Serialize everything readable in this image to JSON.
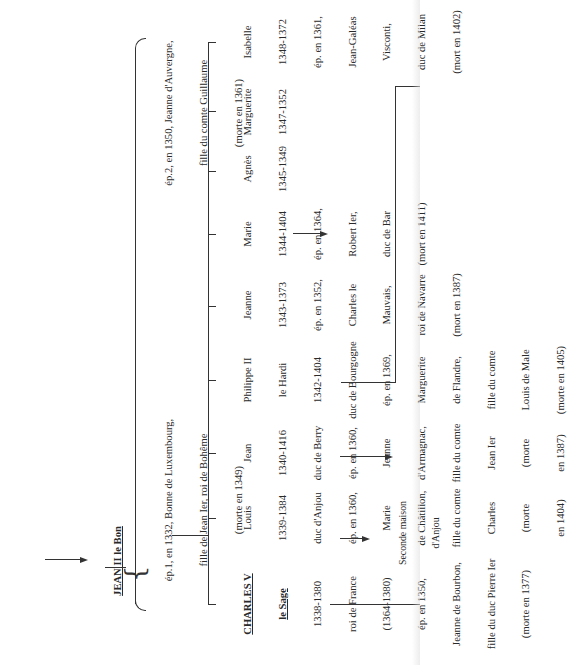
{
  "root": {
    "name": "JEAN II le Bon"
  },
  "spouses": [
    {
      "lines": [
        "ép.1, en 1332, Bonne de Luxembourg,",
        "fille de Jean Ier, roi de Bohême",
        "(morte en 1349)"
      ]
    },
    {
      "lines": [
        "ép.2, en 1350, Jeanne d'Auvergne,",
        "fille du comte Guillaume",
        "(morte en 1361)"
      ]
    }
  ],
  "children": [
    {
      "name": "CHARLES V",
      "epithet": "le Sage",
      "lines": [
        "1338-1380",
        "roi de France",
        "(1364-1380)",
        "ép. en 1350,",
        "Jeanne de Bourbon,",
        "fille du duc Pierre Ier",
        "(morte en 1377)"
      ]
    },
    {
      "name": "Louis",
      "lines": [
        "1339-1384",
        "duc d'Anjou",
        "ép. en 1360,",
        "Marie",
        "de Châtillon,",
        "fille du comte",
        "Charles",
        "(morte",
        "en 1404)"
      ],
      "arrow_label": [
        "Seconde maison",
        "d'Anjou"
      ]
    },
    {
      "name": "Jean",
      "lines": [
        "1340-1416",
        "duc de Berry",
        "ép. en 1360,",
        "Jeanne",
        "d'Armagnac,",
        "fille du comte",
        "Jean Ier",
        "(morte",
        "en 1387)"
      ]
    },
    {
      "name": "Philippe II",
      "lines": [
        "le Hardi",
        "1342-1404",
        "duc de Bourgogne",
        "ép. en 1369,",
        "Marguerite",
        "de Flandre,",
        "fille du comte",
        "Louis de Male",
        "(morte en 1405)"
      ]
    },
    {
      "name": "Jeanne",
      "lines": [
        "1343-1373",
        "ép. en 1352,",
        "Charles le",
        "Mauvais,",
        "roi de Navarre",
        "(mort en 1387)"
      ]
    },
    {
      "name": "Marie",
      "lines": [
        "1344-1404",
        "ép. en 1364,",
        "Robert Ier,",
        "duc de Bar",
        "(mort en 1411)"
      ]
    },
    {
      "name": "Agnès",
      "lines": [
        "1345-1349"
      ]
    },
    {
      "name": "Marguerite",
      "lines": [
        "1347-1352"
      ]
    },
    {
      "name": "Isabelle",
      "lines": [
        "1348-1372",
        "ép. en 1361,",
        "Jean-Galéas",
        "Visconti,",
        "duc de Milan",
        "(mort en 1402)"
      ]
    }
  ],
  "colors": {
    "ink": "#2a2a2a",
    "paper": "#ffffff"
  }
}
